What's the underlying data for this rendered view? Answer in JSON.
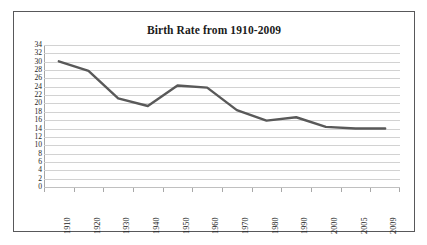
{
  "chart_data": {
    "type": "line",
    "title": "Birth Rate from 1910-2009",
    "xlabel": "",
    "ylabel": "",
    "categories": [
      "1910",
      "1920",
      "1930",
      "1940",
      "1950",
      "1960",
      "1970",
      "1980",
      "1990",
      "2000",
      "2005",
      "2009"
    ],
    "series": [
      {
        "name": "Birth Rate",
        "values": [
          30.1,
          27.8,
          21.2,
          19.4,
          24.3,
          23.8,
          18.4,
          15.9,
          16.7,
          14.4,
          14.0,
          14.0
        ]
      }
    ],
    "ylim": [
      0,
      34
    ],
    "ytick_step": 2,
    "yticks": [
      34,
      32,
      30,
      28,
      26,
      24,
      22,
      20,
      18,
      16,
      14,
      12,
      10,
      8,
      6,
      4,
      2,
      0
    ],
    "grid": true,
    "legend": false,
    "legend_position": "none",
    "line_color": "#595959",
    "gridline_color": "#d2d2d2",
    "axis_color": "#a6a6a6",
    "border_color": "#58585a",
    "background_color": "#ffffff",
    "text_color": "#1d1d1d"
  }
}
